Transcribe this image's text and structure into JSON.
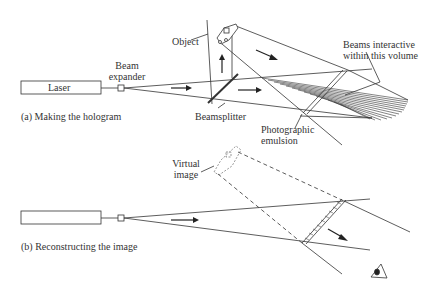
{
  "part_a": {
    "caption": "(a) Making the hologram",
    "laser_label": "Laser",
    "beam_expander_line1": "Beam",
    "beam_expander_line2": "expander",
    "object_label": "Object",
    "beamsplitter_label": "Beamsplitter",
    "emulsion_line1": "Photographic",
    "emulsion_line2": "emulsion",
    "volume_line1": "Beams interactive",
    "volume_line2": "within this volume"
  },
  "part_b": {
    "caption": "(b) Reconstructing the image",
    "virtual_line1": "Virtual",
    "virtual_line2": "image"
  },
  "icons": [
    "laser-box",
    "beam-expander",
    "object-icon",
    "beamsplitter",
    "emulsion-plate",
    "eye-icon",
    "arrow-icon"
  ]
}
